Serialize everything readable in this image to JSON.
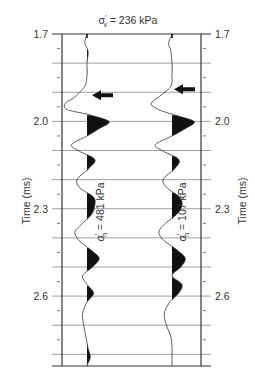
{
  "chart_data": {
    "type": "line",
    "title": "σ′v = 236 kPa",
    "title_parts": {
      "symbol": "σ",
      "prime": "′",
      "subscript": "v",
      "rest": " = 236 kPa"
    },
    "ylabel_left": "Time (ms)",
    "ylabel_right": "Time (ms)",
    "ylim": [
      1.7,
      2.84
    ],
    "y_inverted": true,
    "y_ticks_major": [
      1.7,
      2.0,
      2.3,
      2.6
    ],
    "y_tick_labels": [
      "1.7",
      "2.0",
      "2.3",
      "2.6"
    ],
    "y_ticks_minor_step": 0.05,
    "grid_step": 0.1,
    "grid": true,
    "series": [
      {
        "name": "σ′h = 481 kPa",
        "label_parts": {
          "symbol": "σ",
          "prime": "′",
          "subscript": "h",
          "rest": " = 481 kPa"
        },
        "arrow_time": 1.91,
        "t": [
          1.7,
          1.73,
          1.76,
          1.8,
          1.84,
          1.88,
          1.92,
          1.94,
          1.96,
          1.975,
          2.0,
          2.025,
          2.05,
          2.08,
          2.1,
          2.13,
          2.16,
          2.2,
          2.23,
          2.26,
          2.29,
          2.32,
          2.35,
          2.38,
          2.41,
          2.44,
          2.47,
          2.5,
          2.53,
          2.56,
          2.59,
          2.62,
          2.66,
          2.7,
          2.74,
          2.78,
          2.81,
          2.84
        ],
        "amp": [
          0.0,
          -0.1,
          0.05,
          0.0,
          0.0,
          -0.1,
          -0.6,
          -1.0,
          -0.9,
          0.0,
          1.0,
          0.55,
          0.0,
          -0.7,
          -0.4,
          0.35,
          0.1,
          -0.45,
          -0.3,
          0.3,
          0.35,
          0.2,
          -0.2,
          -0.55,
          -0.35,
          0.15,
          0.55,
          0.25,
          -0.2,
          0.0,
          0.3,
          0.0,
          -0.2,
          -0.15,
          -0.05,
          0.05,
          0.15,
          0.0
        ]
      },
      {
        "name": "σ′h = 107 kPa",
        "label_parts": {
          "symbol": "σ",
          "prime": "′",
          "subscript": "h",
          "rest": " = 107 kPa"
        },
        "arrow_time": 1.89,
        "t": [
          1.7,
          1.73,
          1.76,
          1.8,
          1.84,
          1.88,
          1.91,
          1.94,
          1.96,
          1.975,
          2.0,
          2.025,
          2.05,
          2.08,
          2.1,
          2.13,
          2.16,
          2.2,
          2.23,
          2.26,
          2.29,
          2.32,
          2.35,
          2.38,
          2.41,
          2.44,
          2.47,
          2.5,
          2.53,
          2.56,
          2.59,
          2.62,
          2.66,
          2.7,
          2.74,
          2.78,
          2.81,
          2.84
        ],
        "amp": [
          0.0,
          -0.15,
          -0.05,
          0.0,
          0.0,
          -0.05,
          -0.5,
          -0.95,
          -0.6,
          0.0,
          1.0,
          0.6,
          0.0,
          -0.75,
          -0.45,
          0.3,
          0.15,
          -0.4,
          -0.2,
          0.35,
          0.45,
          0.2,
          -0.3,
          -0.6,
          -0.35,
          0.2,
          0.6,
          0.4,
          0.0,
          0.45,
          0.3,
          -0.1,
          -0.35,
          -0.25,
          -0.05,
          0.0,
          0.0,
          0.0
        ]
      }
    ]
  }
}
